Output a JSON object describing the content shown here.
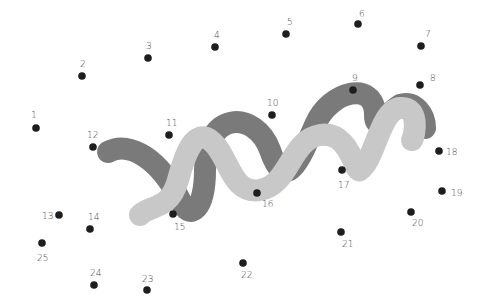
{
  "puzzle": {
    "type": "connect-the-dots",
    "canvas": {
      "width": 498,
      "height": 303,
      "background": "#ffffff"
    },
    "colors": {
      "dot": "#1e1e1e",
      "label": "#444444",
      "dark_band": "#7a7a7a",
      "light_band": "#c8c8c8"
    },
    "dots": [
      {
        "n": "1",
        "x": 36,
        "y": 128,
        "lx": 31,
        "ly": 118
      },
      {
        "n": "2",
        "x": 82,
        "y": 76,
        "lx": 80,
        "ly": 67
      },
      {
        "n": "3",
        "x": 148,
        "y": 58,
        "lx": 146,
        "ly": 49
      },
      {
        "n": "4",
        "x": 215,
        "y": 47,
        "lx": 214,
        "ly": 38
      },
      {
        "n": "5",
        "x": 286,
        "y": 34,
        "lx": 287,
        "ly": 25
      },
      {
        "n": "6",
        "x": 358,
        "y": 24,
        "lx": 359,
        "ly": 17
      },
      {
        "n": "7",
        "x": 421,
        "y": 46,
        "lx": 425,
        "ly": 37
      },
      {
        "n": "8",
        "x": 420,
        "y": 85,
        "lx": 430,
        "ly": 81
      },
      {
        "n": "9",
        "x": 353,
        "y": 90,
        "lx": 352,
        "ly": 81
      },
      {
        "n": "10",
        "x": 272,
        "y": 115,
        "lx": 267,
        "ly": 106
      },
      {
        "n": "11",
        "x": 169,
        "y": 135,
        "lx": 166,
        "ly": 126
      },
      {
        "n": "12",
        "x": 93,
        "y": 147,
        "lx": 87,
        "ly": 138
      },
      {
        "n": "13",
        "x": 59,
        "y": 215,
        "lx": 42,
        "ly": 219
      },
      {
        "n": "14",
        "x": 90,
        "y": 229,
        "lx": 88,
        "ly": 220
      },
      {
        "n": "15",
        "x": 173,
        "y": 214,
        "lx": 174,
        "ly": 230
      },
      {
        "n": "16",
        "x": 257,
        "y": 193,
        "lx": 262,
        "ly": 207
      },
      {
        "n": "17",
        "x": 342,
        "y": 170,
        "lx": 338,
        "ly": 188
      },
      {
        "n": "18",
        "x": 439,
        "y": 151,
        "lx": 446,
        "ly": 155
      },
      {
        "n": "19",
        "x": 442,
        "y": 191,
        "lx": 451,
        "ly": 196
      },
      {
        "n": "20",
        "x": 411,
        "y": 212,
        "lx": 412,
        "ly": 226
      },
      {
        "n": "21",
        "x": 341,
        "y": 232,
        "lx": 342,
        "ly": 247
      },
      {
        "n": "22",
        "x": 243,
        "y": 263,
        "lx": 241,
        "ly": 278
      },
      {
        "n": "23",
        "x": 147,
        "y": 290,
        "lx": 142,
        "ly": 282
      },
      {
        "n": "24",
        "x": 94,
        "y": 285,
        "lx": 90,
        "ly": 276
      },
      {
        "n": "25",
        "x": 42,
        "y": 243,
        "lx": 37,
        "ly": 261
      }
    ],
    "bands": {
      "dark": "M 108 152 C 130 140, 160 160, 180 200 C 190 222, 205 210, 205 170 C 205 110, 255 110, 270 150 C 285 195, 300 160, 315 125 C 330 90, 375 80, 375 115 C 375 135, 390 110, 400 105 C 415 100, 425 115, 425 128",
      "light": "M 140 215 C 150 205, 170 210, 178 180 C 186 150, 195 130, 210 140 C 230 155, 230 195, 260 190 C 290 185, 290 140, 320 135 C 350 130, 355 175, 360 170 C 375 160, 380 110, 400 108 C 420 106, 415 135, 412 140"
    }
  }
}
